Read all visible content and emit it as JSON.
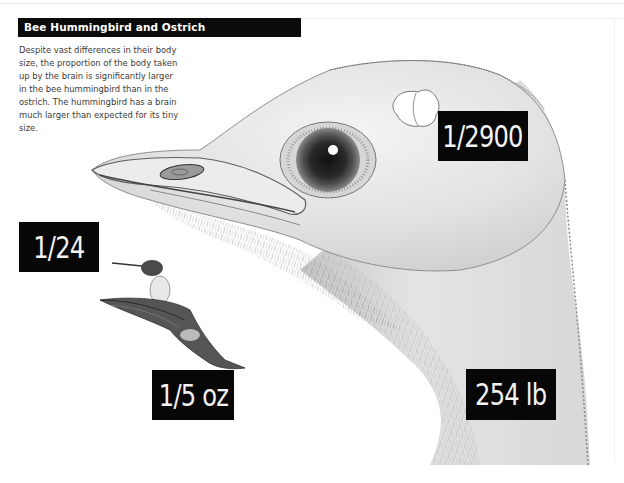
{
  "header": {
    "title": "Bee Hummingbird and Ostrich"
  },
  "caption": {
    "text": "Despite vast differences in their body size, the proportion of the body taken up by the brain is significantly larger in the bee hummingbird than in the ostrich. The hummingbird has a brain much larger than expected for its tiny size."
  },
  "labels": {
    "hummingbird_brain_ratio": "1/24",
    "hummingbird_weight": "1/5 oz",
    "ostrich_brain_ratio": "1/2900",
    "ostrich_weight": "254 lb"
  },
  "illustrations": {
    "ostrich": "ostrich-head-illustration",
    "hummingbird": "bee-hummingbird-illustration",
    "brain": "ostrich-brain-outline"
  },
  "colors": {
    "label_bg": "#070707",
    "label_text": "#f2f2f2",
    "title_bg": "#0b0b0b",
    "body_text": "#3a3a3a"
  }
}
